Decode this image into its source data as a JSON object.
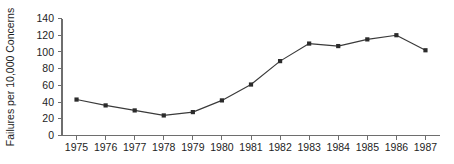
{
  "chart_data": {
    "type": "line",
    "title": "",
    "subtitle": "",
    "xlabel": "",
    "ylabel": "Failures per 10,000 Concerns",
    "categories": [
      "1975",
      "1976",
      "1977",
      "1978",
      "1979",
      "1980",
      "1981",
      "1982",
      "1983",
      "1984",
      "1985",
      "1986",
      "1987"
    ],
    "x": [
      1975,
      1976,
      1977,
      1978,
      1979,
      1980,
      1981,
      1982,
      1983,
      1984,
      1985,
      1986,
      1987
    ],
    "values": [
      43,
      36,
      30,
      24,
      28,
      42,
      61,
      89,
      110,
      107,
      115,
      120,
      102
    ],
    "series": [
      {
        "name": "Failures per 10,000 Concerns",
        "values": [
          43,
          36,
          30,
          24,
          28,
          42,
          61,
          89,
          110,
          107,
          115,
          120,
          102
        ],
        "color": "#3a3a3a",
        "marker": "square"
      }
    ],
    "ylim": [
      0,
      140
    ],
    "yticks": [
      0,
      20,
      40,
      60,
      80,
      100,
      120,
      140
    ],
    "ytick_labels": [
      "0",
      "20",
      "40",
      "60",
      "80",
      "100",
      "120",
      "140"
    ],
    "xtick_labels": [
      "1975",
      "1976",
      "1977",
      "1978",
      "1979",
      "1980",
      "1981",
      "1982",
      "1983",
      "1984",
      "1985",
      "1986",
      "1987"
    ],
    "grid": false,
    "legend": false,
    "legend_position": "none",
    "annotations": []
  },
  "colors": {
    "background": "#ffffff",
    "axis": "#6e6e6e",
    "text": "#1d1d1d",
    "series": "#3a3a3a",
    "marker": "#2b2b2b"
  }
}
